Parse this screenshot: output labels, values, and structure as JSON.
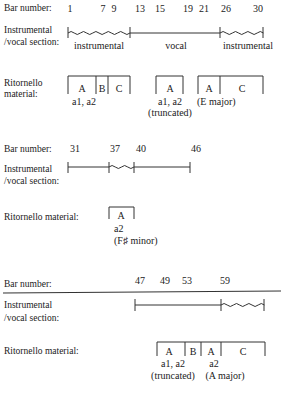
{
  "labels": {
    "bar_number": "Bar number:",
    "instr_line1": "Instrumental",
    "instr_line2": "/vocal section:",
    "ritornello_line1": "Ritornello",
    "ritornello_line2": "material:",
    "ritornello_full": "Ritornello material:"
  },
  "section1": {
    "bar_numbers": [
      "1",
      "7",
      "9",
      "13",
      "15",
      "19",
      "21",
      "26",
      "30"
    ],
    "sections": [
      {
        "type": "wavy",
        "label": "instrumental",
        "from_bar": "1",
        "to_bar": "13"
      },
      {
        "type": "straight",
        "label": "vocal",
        "from_bar": "13",
        "to_bar": "26"
      },
      {
        "type": "wavy",
        "label": "instrumental",
        "from_bar": "26",
        "to_bar": "30"
      }
    ],
    "ritornello_groups": [
      {
        "segments": [
          "A",
          "B",
          "C"
        ],
        "note1": "a1, a2",
        "note2": ""
      },
      {
        "segments": [
          "A"
        ],
        "note1": "a1, a2",
        "note2": "(truncated)"
      },
      {
        "segments": [
          "A",
          "C"
        ],
        "note1": "(E major)",
        "note2": ""
      }
    ]
  },
  "section2": {
    "bar_numbers": [
      "31",
      "37",
      "40",
      "46"
    ],
    "sections": [
      {
        "type": "straight",
        "from_bar": "31",
        "to_bar": "37"
      },
      {
        "type": "wavy",
        "from_bar": "37",
        "to_bar": "40"
      },
      {
        "type": "straight",
        "from_bar": "40",
        "to_bar": "46"
      }
    ],
    "ritornello_groups": [
      {
        "segments": [
          "A"
        ],
        "note1": "a2",
        "note2": "(F♯ minor)"
      }
    ]
  },
  "section3": {
    "bar_numbers": [
      "47",
      "49",
      "53",
      "59"
    ],
    "sections": [
      {
        "type": "straight",
        "from_bar": "47",
        "to_bar": "59"
      },
      {
        "type": "wavy",
        "from_bar": "59",
        "to_bar": "end"
      }
    ],
    "ritornello_groups": [
      {
        "segments": [
          "A",
          "B",
          "A",
          "C"
        ],
        "notes": [
          {
            "note1": "a1, a2",
            "note2": "(truncated)"
          },
          {
            "note1": "a2",
            "note2": "(A major)"
          }
        ]
      }
    ]
  }
}
